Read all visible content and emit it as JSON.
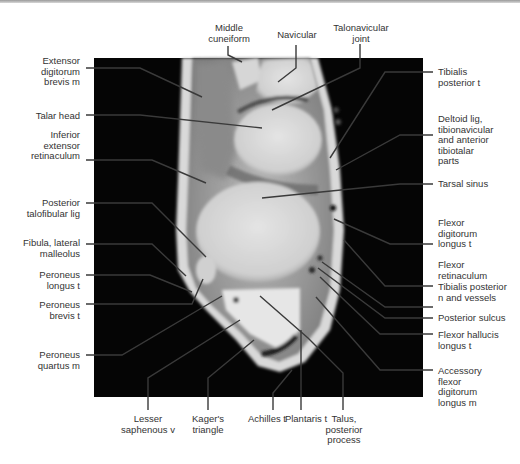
{
  "figure": {
    "labels_top": [
      {
        "id": "middle-cuneiform",
        "text": "Middle\ncuneiform"
      },
      {
        "id": "navicular",
        "text": "Navicular"
      },
      {
        "id": "talonavicular-joint",
        "text": "Talonavicular\njoint"
      }
    ],
    "labels_left": [
      {
        "id": "extensor-digitorum-brevis",
        "text": "Extensor\ndigitorum\nbrevis m"
      },
      {
        "id": "talar-head",
        "text": "Talar head"
      },
      {
        "id": "inferior-extensor-retinaculum",
        "text": "Inferior\nextensor\nretinaculum"
      },
      {
        "id": "posterior-talofibular-lig",
        "text": "Posterior\ntalofibular lig"
      },
      {
        "id": "fibula-lateral-malleolus",
        "text": "Fibula, lateral\nmalleolus"
      },
      {
        "id": "peroneus-longus",
        "text": "Peroneus\nlongus t"
      },
      {
        "id": "peroneus-brevis",
        "text": "Peroneus\nbrevis t"
      },
      {
        "id": "peroneus-quartus",
        "text": "Peroneus\nquartus m"
      }
    ],
    "labels_right": [
      {
        "id": "tibialis-posterior-t",
        "text": "Tibialis\nposterior t"
      },
      {
        "id": "deltoid-lig",
        "text": "Deltoid lig,\ntibionavicular\nand anterior\ntibiotalar\nparts"
      },
      {
        "id": "tarsal-sinus",
        "text": "Tarsal sinus"
      },
      {
        "id": "flexor-digitorum-longus",
        "text": "Flexor\ndigitorum\nlongus t"
      },
      {
        "id": "flexor-retinaculum",
        "text": "Flexor\nretinaculum"
      },
      {
        "id": "tibialis-posterior-n",
        "text": "Tibialis posterior\nn and vessels"
      },
      {
        "id": "posterior-sulcus",
        "text": "Posterior sulcus"
      },
      {
        "id": "flexor-hallucis-longus",
        "text": "Flexor hallucis\nlongus t"
      },
      {
        "id": "accessory-fdl",
        "text": "Accessory\nflexor\ndigitorum\nlongus m"
      }
    ],
    "labels_bottom": [
      {
        "id": "lesser-saphenous",
        "text": "Lesser\nsaphenous v"
      },
      {
        "id": "kagers-triangle",
        "text": "Kager's\ntriangle"
      },
      {
        "id": "achilles",
        "text": "Achilles t"
      },
      {
        "id": "plantaris",
        "text": "Plantaris t"
      },
      {
        "id": "talus-posterior-process",
        "text": "Talus,\nposterior\nprocess"
      }
    ],
    "colors": {
      "background": "#ffffff",
      "mri_background": "#050505",
      "leader_line": "#3a3a3a",
      "label_text": "#333333"
    }
  }
}
